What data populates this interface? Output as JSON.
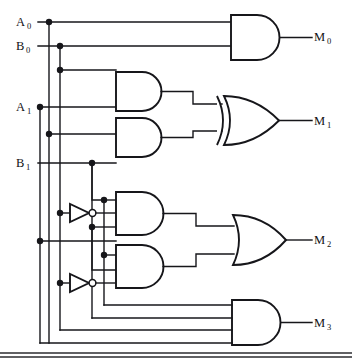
{
  "diagram": {
    "type": "logic-circuit-schematic"
  },
  "inputs": [
    {
      "id": "A0",
      "label": "A",
      "subscript": "0",
      "x": 18,
      "y": 22
    },
    {
      "id": "B0",
      "label": "B",
      "subscript": "0",
      "x": 18,
      "y": 46
    },
    {
      "id": "A1",
      "label": "A",
      "subscript": "1",
      "x": 18,
      "y": 107
    },
    {
      "id": "B1",
      "label": "B",
      "subscript": "1",
      "x": 18,
      "y": 163
    }
  ],
  "outputs": [
    {
      "id": "M0",
      "label": "M",
      "subscript": "0",
      "x": 316,
      "y": 36
    },
    {
      "id": "M1",
      "label": "M",
      "subscript": "1",
      "x": 316,
      "y": 121
    },
    {
      "id": "M2",
      "label": "M",
      "subscript": "2",
      "x": 316,
      "y": 240
    },
    {
      "id": "M3",
      "label": "M",
      "subscript": "3",
      "x": 316,
      "y": 322
    }
  ],
  "gates": [
    {
      "id": "and-m0",
      "kind": "AND",
      "inputs": 2,
      "drives": "M0"
    },
    {
      "id": "and-x1",
      "kind": "AND",
      "inputs": 2,
      "drives": "xor-m1"
    },
    {
      "id": "and-x2",
      "kind": "AND",
      "inputs": 2,
      "drives": "xor-m1"
    },
    {
      "id": "xor-m1",
      "kind": "XOR",
      "inputs": 2,
      "drives": "M1"
    },
    {
      "id": "and-y1",
      "kind": "AND",
      "inputs": 3,
      "drives": "or-m2"
    },
    {
      "id": "and-y2",
      "kind": "AND",
      "inputs": 3,
      "drives": "or-m2"
    },
    {
      "id": "or-m2",
      "kind": "OR",
      "inputs": 2,
      "drives": "M2"
    },
    {
      "id": "and-m3",
      "kind": "AND",
      "inputs": 4,
      "drives": "M3"
    }
  ],
  "inverters": [
    {
      "id": "inv-1",
      "x": 70,
      "y": 213
    },
    {
      "id": "inv-2",
      "x": 70,
      "y": 283
    }
  ],
  "colors": {
    "wire": "#16161a",
    "gate_fill": "#ffffff",
    "background": "#ffffff",
    "rule": "#2b2b2f"
  }
}
